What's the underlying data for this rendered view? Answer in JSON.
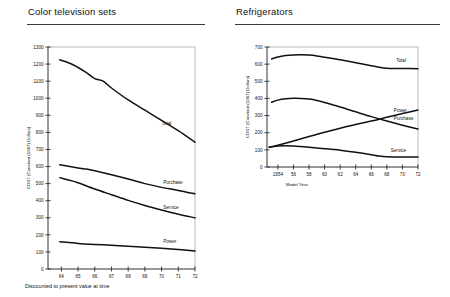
{
  "figures": [
    {
      "title": "Color television sets",
      "footnote": "Discounted to present value at time",
      "chart_data": {
        "type": "line",
        "title": "Color television sets",
        "xlabel": "",
        "ylabel": "COST (Constant (1967) Dollars)",
        "xlim": [
          63.2,
          72
        ],
        "ylim": [
          0,
          1300
        ],
        "xticks": [
          "64",
          "65",
          "66",
          "67",
          "68",
          "69",
          "70",
          "71",
          "72"
        ],
        "xtick_values": [
          64,
          65,
          66,
          67,
          68,
          69,
          70,
          71,
          72
        ],
        "yticks": [
          "0",
          "100",
          "200",
          "300",
          "400",
          "500",
          "600",
          "700",
          "800",
          "900",
          "1000",
          "1100",
          "1200",
          "1300"
        ],
        "ytick_values": [
          0,
          100,
          200,
          300,
          400,
          500,
          600,
          700,
          800,
          900,
          1000,
          1100,
          1200,
          1300
        ],
        "grid": false,
        "legend": "inline-labels",
        "series": [
          {
            "name": "Total",
            "label_x": 70.0,
            "label_y": 845,
            "x": [
              63.9,
              64.5,
              65.0,
              65.5,
              66.0,
              66.5,
              67.0,
              68.0,
              69.0,
              70.0,
              71.0,
              72.0
            ],
            "values": [
              1225,
              1205,
              1180,
              1150,
              1115,
              1100,
              1060,
              990,
              930,
              870,
              810,
              742
            ]
          },
          {
            "name": "Purchase",
            "label_x": 70.1,
            "label_y": 497,
            "x": [
              63.9,
              64.5,
              65.0,
              65.5,
              66.0,
              67.0,
              68.0,
              69.0,
              70.0,
              71.0,
              72.0
            ],
            "values": [
              610,
              600,
              592,
              585,
              575,
              552,
              527,
              500,
              478,
              460,
              440
            ]
          },
          {
            "name": "Service",
            "label_x": 70.1,
            "label_y": 352,
            "x": [
              63.9,
              64.5,
              65.0,
              66.0,
              67.0,
              68.0,
              69.0,
              70.0,
              71.0,
              72.0
            ],
            "values": [
              535,
              520,
              505,
              468,
              435,
              402,
              372,
              345,
              320,
              300
            ]
          },
          {
            "name": "Power",
            "label_x": 70.1,
            "label_y": 152,
            "x": [
              63.9,
              64.5,
              65.0,
              66.0,
              67.0,
              68.0,
              69.0,
              70.0,
              71.0,
              72.0
            ],
            "values": [
              160,
              155,
              150,
              144,
              139,
              133,
              127,
              121,
              114,
              106
            ]
          }
        ]
      }
    },
    {
      "title": "Refrigerators",
      "footnote": "",
      "chart_data": {
        "type": "line",
        "title": "Refrigerators",
        "xlabel": "Model Year",
        "ylabel": "COST (Constant (1967) Dollars)",
        "xlim": [
          1952.6,
          1972
        ],
        "ylim": [
          0,
          700
        ],
        "xticks": [
          "1954",
          "56",
          "58",
          "60",
          "62",
          "64",
          "66",
          "68",
          "70",
          "72"
        ],
        "xtick_values": [
          1954,
          1956,
          1958,
          1960,
          1962,
          1964,
          1966,
          1968,
          1970,
          1972
        ],
        "yticks": [
          "0",
          "100",
          "200",
          "300",
          "400",
          "500",
          "600",
          "700"
        ],
        "ytick_values": [
          0,
          100,
          200,
          300,
          400,
          500,
          600,
          700
        ],
        "grid": false,
        "legend": "inline-labels",
        "series": [
          {
            "name": "Total",
            "label_x": 1969.2,
            "label_y": 612,
            "x": [
              1953.2,
              1954,
              1955,
              1956,
              1957,
              1958,
              1959,
              1960,
              1962,
              1964,
              1966,
              1967,
              1968,
              1969,
              1970,
              1971,
              1972
            ],
            "values": [
              630,
              642,
              650,
              654,
              655,
              653,
              648,
              640,
              625,
              608,
              590,
              582,
              576,
              574,
              574,
              574,
              573
            ]
          },
          {
            "name": "Purchase",
            "label_x": 1968.9,
            "label_y": 272,
            "x": [
              1953.2,
              1954,
              1955,
              1956,
              1957,
              1958,
              1959,
              1960,
              1962,
              1964,
              1966,
              1968,
              1970,
              1972
            ],
            "values": [
              378,
              390,
              398,
              401,
              400,
              396,
              388,
              376,
              350,
              322,
              294,
              268,
              244,
              222
            ]
          },
          {
            "name": "Power",
            "label_x": 1968.9,
            "label_y": 318,
            "x": [
              1952.9,
              1954,
              1956,
              1958,
              1960,
              1962,
              1964,
              1966,
              1968,
              1970,
              1972
            ],
            "values": [
              115,
              127,
              152,
              178,
              203,
              226,
              248,
              268,
              290,
              312,
              333
            ]
          },
          {
            "name": "Service",
            "label_x": 1968.5,
            "label_y": 88,
            "x": [
              1952.9,
              1954,
              1955,
              1956,
              1958,
              1960,
              1962,
              1964,
              1966,
              1967,
              1968,
              1970,
              1972
            ],
            "values": [
              116,
              122,
              124,
              122,
              115,
              107,
              98,
              86,
              72,
              64,
              60,
              58,
              58
            ]
          }
        ]
      }
    }
  ]
}
